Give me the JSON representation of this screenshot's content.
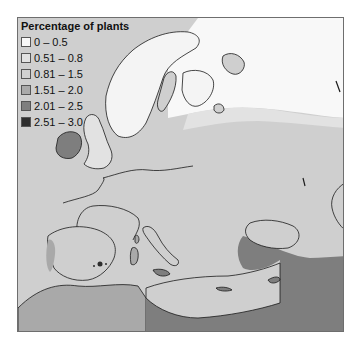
{
  "legend": {
    "title": "Percentage of plants",
    "items": [
      {
        "label": "0 – 0.5",
        "color": "#f8f8f8"
      },
      {
        "label": "0.51 – 0.8",
        "color": "#e2e2e2"
      },
      {
        "label": "0.81 – 1.5",
        "color": "#d0d0d0"
      },
      {
        "label": "1.51 – 2.0",
        "color": "#a9a9a9"
      },
      {
        "label": "2.01 – 2.5",
        "color": "#7e7e7e"
      },
      {
        "label": "2.51 – 3.0",
        "color": "#2e2e2e"
      }
    ]
  },
  "map": {
    "region": "Europe and Mediterranean",
    "background_color": "#cfcfcf",
    "coastline_color": "#1a1a1a"
  }
}
